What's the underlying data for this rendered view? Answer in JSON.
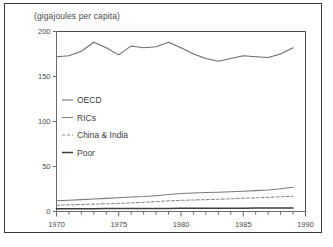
{
  "figure": {
    "title": "(gigajoules per capita)",
    "caption_clipped": "",
    "frame_color": "#3a3a3a",
    "background": "#ffffff"
  },
  "chart_data": {
    "type": "line",
    "title": "(gigajoules per capita)",
    "xlabel": "",
    "ylabel": "(gigajoules per capita)",
    "xlim": [
      1970,
      1990
    ],
    "ylim": [
      0,
      200
    ],
    "yticks": [
      0,
      50,
      100,
      150,
      200
    ],
    "xticks": [
      1970,
      1975,
      1980,
      1985,
      1990
    ],
    "xminor_step": 1,
    "grid": false,
    "legend_position": "center-left inside axes",
    "x": [
      1970,
      1971,
      1972,
      1973,
      1974,
      1975,
      1976,
      1977,
      1978,
      1979,
      1980,
      1981,
      1982,
      1983,
      1984,
      1985,
      1986,
      1987,
      1988,
      1989
    ],
    "series": [
      {
        "name": "OECD",
        "style": "solid",
        "color": "#6b6b6b",
        "values": [
          172,
          173,
          178,
          188,
          182,
          174,
          184,
          182,
          183,
          188,
          182,
          175,
          170,
          167,
          170,
          173,
          172,
          171,
          175,
          182
        ]
      },
      {
        "name": "RICs",
        "style": "solid",
        "color": "#7a7a7a",
        "values": [
          12,
          12.6,
          13.2,
          14,
          14.6,
          15.2,
          16,
          16.6,
          17.6,
          18.8,
          20,
          20.6,
          21,
          21.4,
          22,
          22.6,
          23.2,
          24,
          25.2,
          27
        ]
      },
      {
        "name": "China & India",
        "style": "dashed",
        "color": "#8a8a8a",
        "values": [
          7,
          7.4,
          7.8,
          8.2,
          8.6,
          9,
          9.6,
          10.2,
          11,
          11.8,
          12.4,
          12.8,
          13.2,
          13.6,
          14.2,
          14.8,
          15.2,
          15.8,
          16.4,
          17
        ]
      },
      {
        "name": "Poor",
        "style": "solid",
        "color": "#3c3c3c",
        "values": [
          3,
          3.05,
          3.1,
          3.15,
          3.2,
          3.25,
          3.3,
          3.35,
          3.4,
          3.45,
          3.5,
          3.55,
          3.6,
          3.65,
          3.7,
          3.75,
          3.8,
          3.85,
          3.9,
          4
        ]
      }
    ],
    "legend": [
      "OECD",
      "RICs",
      "China & India",
      "Poor"
    ]
  }
}
